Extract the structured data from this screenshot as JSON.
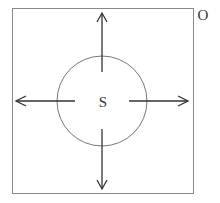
{
  "diagram": {
    "source_label": "S",
    "corner_label": "O",
    "colors": {
      "box": "#888888",
      "circle": "#777777",
      "arrow": "#333333",
      "text": "#333333"
    }
  }
}
